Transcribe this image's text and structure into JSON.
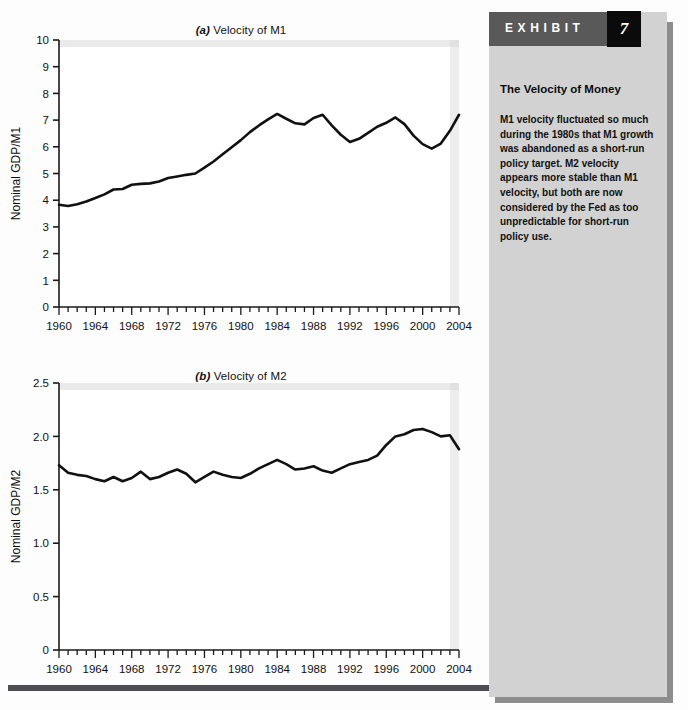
{
  "exhibit": {
    "band_label": "EXHIBIT",
    "number": "7",
    "heading": "The Velocity of Money",
    "body": "M1 velocity fluctuated so much during the 1980s that M1 growth was abandoned as a short-run policy target. M2 velocity appears more stable than M1 velocity, but both are now considered by the Fed as too unpredictable for short-run policy use."
  },
  "panel_a": {
    "title_prefix": "(a)",
    "title_text": " Velocity of M1"
  },
  "panel_b": {
    "title_prefix": "(b)",
    "title_text": " Velocity of M2"
  },
  "chart_data": [
    {
      "type": "line",
      "id": "velocity-m1",
      "title": "(a) Velocity of M1",
      "xlabel": "",
      "ylabel": "Nominal GDP/M1",
      "xlim": [
        1960,
        2004
      ],
      "ylim": [
        0,
        10
      ],
      "ytick_labels": [
        "0",
        "1",
        "2",
        "3",
        "4",
        "5",
        "6",
        "7",
        "8",
        "9",
        "10"
      ],
      "yticks": [
        0,
        1,
        2,
        3,
        4,
        5,
        6,
        7,
        8,
        9,
        10
      ],
      "xtick_labels": [
        "1960",
        "1964",
        "1968",
        "1972",
        "1976",
        "1980",
        "1984",
        "1988",
        "1992",
        "1996",
        "2000",
        "2004"
      ],
      "xticks": [
        1960,
        1964,
        1968,
        1972,
        1976,
        1980,
        1984,
        1988,
        1992,
        1996,
        2000,
        2004
      ],
      "minor_xtick_step": 1,
      "grid": false,
      "legend": "none",
      "line_color": "#111111",
      "x": [
        1960,
        1961,
        1962,
        1963,
        1964,
        1965,
        1966,
        1967,
        1968,
        1969,
        1970,
        1971,
        1972,
        1973,
        1974,
        1975,
        1976,
        1977,
        1978,
        1979,
        1980,
        1981,
        1982,
        1983,
        1984,
        1985,
        1986,
        1987,
        1988,
        1989,
        1990,
        1991,
        1992,
        1993,
        1994,
        1995,
        1996,
        1997,
        1998,
        1999,
        2000,
        2001,
        2002,
        2003,
        2004
      ],
      "y": [
        3.83,
        3.78,
        3.85,
        3.95,
        4.08,
        4.22,
        4.4,
        4.42,
        4.58,
        4.61,
        4.63,
        4.7,
        4.83,
        4.89,
        4.95,
        5.0,
        5.22,
        5.45,
        5.72,
        5.98,
        6.25,
        6.55,
        6.8,
        7.03,
        7.23,
        7.05,
        6.88,
        6.84,
        7.08,
        7.2,
        6.8,
        6.45,
        6.18,
        6.3,
        6.52,
        6.75,
        6.9,
        7.1,
        6.85,
        6.42,
        6.1,
        5.93,
        6.12,
        6.6,
        7.2,
        7.78,
        8.22,
        8.55,
        8.9,
        8.72,
        8.6,
        8.65,
        8.55
      ],
      "series_note": "M1 velocity, annual, 1960-2004"
    },
    {
      "type": "line",
      "id": "velocity-m2",
      "title": "(b) Velocity of M2",
      "xlabel": "",
      "ylabel": "Nominal GDP/M2",
      "xlim": [
        1960,
        2004
      ],
      "ylim": [
        0,
        2.5
      ],
      "ytick_labels": [
        "0",
        "0.5",
        "1.0",
        "1.5",
        "2.0",
        "2.5"
      ],
      "yticks": [
        0,
        0.5,
        1.0,
        1.5,
        2.0,
        2.5
      ],
      "xtick_labels": [
        "1960",
        "1964",
        "1968",
        "1972",
        "1976",
        "1980",
        "1984",
        "1988",
        "1992",
        "1996",
        "2000",
        "2004"
      ],
      "xticks": [
        1960,
        1964,
        1968,
        1972,
        1976,
        1980,
        1984,
        1988,
        1992,
        1996,
        2000,
        2004
      ],
      "minor_xtick_step": 1,
      "grid": false,
      "legend": "none",
      "line_color": "#111111",
      "x": [
        1960,
        1961,
        1962,
        1963,
        1964,
        1965,
        1966,
        1967,
        1968,
        1969,
        1970,
        1971,
        1972,
        1973,
        1974,
        1975,
        1976,
        1977,
        1978,
        1979,
        1980,
        1981,
        1982,
        1983,
        1984,
        1985,
        1986,
        1987,
        1988,
        1989,
        1990,
        1991,
        1992,
        1993,
        1994,
        1995,
        1996,
        1997,
        1998,
        1999,
        2000,
        2001,
        2002,
        2003,
        2004
      ],
      "y": [
        1.73,
        1.66,
        1.64,
        1.63,
        1.6,
        1.58,
        1.62,
        1.58,
        1.61,
        1.67,
        1.6,
        1.62,
        1.66,
        1.69,
        1.65,
        1.57,
        1.62,
        1.67,
        1.64,
        1.62,
        1.61,
        1.65,
        1.7,
        1.74,
        1.78,
        1.74,
        1.69,
        1.7,
        1.72,
        1.68,
        1.66,
        1.7,
        1.74,
        1.76,
        1.78,
        1.82,
        1.92,
        2.0,
        2.02,
        2.06,
        2.07,
        2.04,
        2.0,
        2.01,
        1.88
      ],
      "series_note": "M2 velocity, annual, 1960-2004"
    }
  ]
}
